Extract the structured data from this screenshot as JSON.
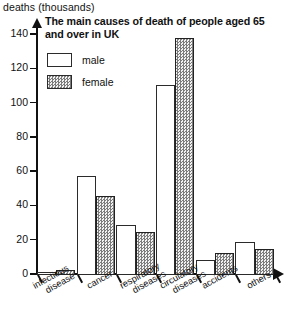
{
  "axis_caption": "deaths (thousands)",
  "title": "The main causes of death of people aged 65 and over in UK",
  "legend": {
    "male_label": "male",
    "female_label": "female"
  },
  "colors": {
    "male_fill": "#ffffff",
    "female_fill": "#7c7c7c",
    "outline": "#2b2b2b",
    "background": "#ffffff"
  },
  "chart_data": {
    "type": "bar",
    "title": "The main causes of death of people aged 65 and over in UK",
    "xlabel": "",
    "ylabel": "deaths (thousands)",
    "ylim": [
      0,
      140
    ],
    "yticks": [
      0,
      20,
      40,
      60,
      80,
      100,
      120,
      140
    ],
    "ytick_labels": [
      "0",
      "20",
      "40",
      "60",
      "80",
      "100",
      "120",
      "140"
    ],
    "grid": false,
    "legend_position": "top-left-inside",
    "categories": [
      "infectious disease",
      "cancer",
      "respiratory diseases",
      "circulatory diseases",
      "accidents",
      "others"
    ],
    "category_lines": [
      [
        "infectious",
        "disease"
      ],
      [
        "cancer"
      ],
      [
        "respiratory",
        "diseases"
      ],
      [
        "circulatory",
        "diseases"
      ],
      [
        "accidents"
      ],
      [
        "others"
      ]
    ],
    "series": [
      {
        "name": "male",
        "values": [
          2,
          58,
          29,
          111,
          9,
          19
        ]
      },
      {
        "name": "female",
        "values": [
          3,
          46,
          25,
          138,
          13,
          15
        ]
      }
    ]
  }
}
